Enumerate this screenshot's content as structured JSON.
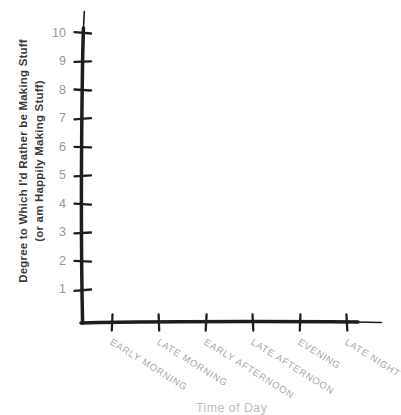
{
  "chart_data": {
    "type": "line",
    "title": "",
    "style": "hand-drawn axes, no plotted data",
    "y_axis_label_line1": "Degree to Which I'd Rather be Making Stuff",
    "y_axis_label_line2": "(or am Happily Making Stuff)",
    "x_axis_label": "Time of Day",
    "categories": [
      "EARLY MORNING",
      "LATE MORNING",
      "EARLY AFTERNOON",
      "LATE AFTERNOON",
      "EVENING",
      "LATE NIGHT"
    ],
    "y_ticks": [
      1,
      2,
      3,
      4,
      5,
      6,
      7,
      8,
      9,
      10
    ],
    "ylim": [
      0,
      10.5
    ],
    "series": [],
    "grid": false,
    "legend": "none",
    "colors": {
      "background": "#ffffff",
      "axis_line": "#1d1d1d",
      "y_tick_labels": "#979797",
      "x_tick_labels": "#a6a6a6",
      "y_axis_title": "#3a3a3a",
      "x_axis_title": "#bdbdbd"
    }
  }
}
